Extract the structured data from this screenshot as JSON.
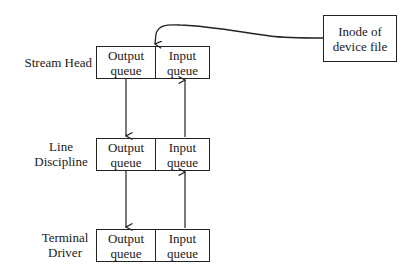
{
  "diagram": {
    "layers": [
      {
        "label_lines": [
          "Stream Head"
        ],
        "output_queue": [
          "Output",
          "queue"
        ],
        "input_queue": [
          "Input",
          "queue"
        ]
      },
      {
        "label_lines": [
          "Line",
          "Discipline"
        ],
        "output_queue": [
          "Output",
          "queue"
        ],
        "input_queue": [
          "Input",
          "queue"
        ]
      },
      {
        "label_lines": [
          "Terminal",
          "Driver"
        ],
        "output_queue": [
          "Output",
          "queue"
        ],
        "input_queue": [
          "Input",
          "queue"
        ]
      }
    ],
    "inode": {
      "lines": [
        "Inode of",
        "device file"
      ]
    },
    "edges": [
      {
        "from": "inode",
        "to": "stream-head",
        "type": "curved-arrow"
      },
      {
        "from": "stream-head.output",
        "to": "line-discipline.output",
        "direction": "down"
      },
      {
        "from": "line-discipline.output",
        "to": "terminal-driver.output",
        "direction": "down"
      },
      {
        "from": "terminal-driver.input",
        "to": "line-discipline.input",
        "direction": "up"
      },
      {
        "from": "line-discipline.input",
        "to": "stream-head.input",
        "direction": "up"
      }
    ],
    "colors": {
      "stroke": "#222222",
      "background": "#ffffff",
      "text": "#1a1a1a"
    }
  }
}
